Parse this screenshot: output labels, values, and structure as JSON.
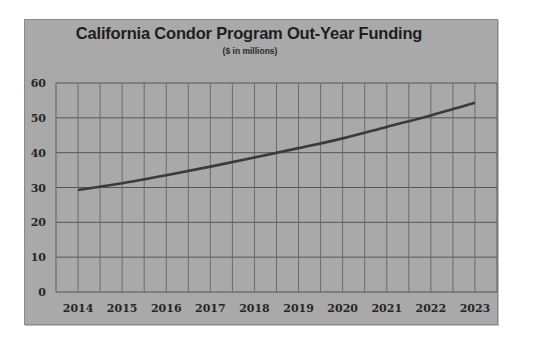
{
  "chart_data": {
    "type": "line",
    "title": "California Condor Program Out-Year Funding",
    "subtitle": "($ in millions)",
    "xlabel": "",
    "ylabel": "",
    "categories": [
      "2014",
      "2015",
      "2016",
      "2017",
      "2018",
      "2019",
      "2020",
      "2021",
      "2022",
      "2023"
    ],
    "series": [
      {
        "name": "Funding",
        "values": [
          29.3,
          31.2,
          33.5,
          36.0,
          38.6,
          41.3,
          44.1,
          47.4,
          50.7,
          54.3
        ],
        "color": "#3a3a3a"
      }
    ],
    "ylim": [
      0,
      60
    ],
    "yticks": [
      "0",
      "10",
      "20",
      "30",
      "40",
      "50",
      "60"
    ],
    "grid": true,
    "legend": "none"
  },
  "colors": {
    "panel_bg": "#a9a9a9",
    "grid": "#555555",
    "line": "#3a3a3a"
  }
}
